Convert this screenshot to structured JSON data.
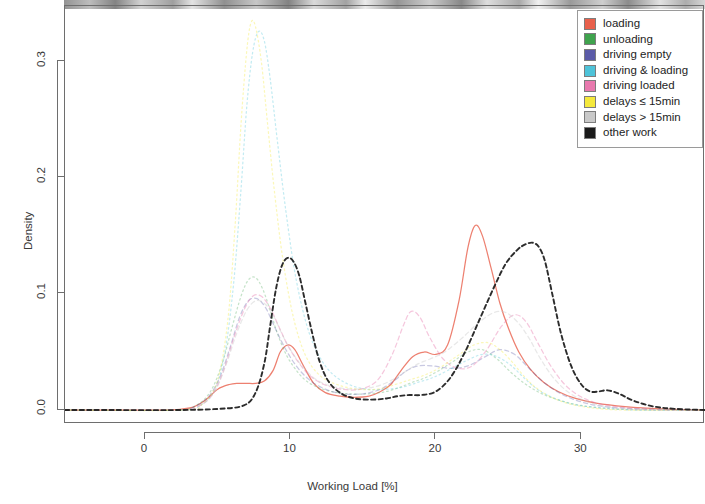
{
  "chart_data": {
    "type": "line",
    "title": "",
    "xlabel": "Working Load [%]",
    "ylabel": "Density",
    "xlim": [
      -5.5,
      38.5
    ],
    "ylim": [
      -0.012,
      0.348
    ],
    "xticks": [
      0,
      10,
      20,
      30
    ],
    "xtick_labels": [
      "0",
      "10",
      "20",
      "30"
    ],
    "yticks": [
      0.0,
      0.1,
      0.2,
      0.3
    ],
    "ytick_labels": [
      "0.0",
      "0.1",
      "0.2",
      "0.3"
    ],
    "grid": false,
    "legend_position": "top-right",
    "series": [
      {
        "name": "loading",
        "color": "#E8604C",
        "dash": "solid",
        "x": [
          -5.5,
          1.0,
          2.6,
          3.4,
          4.2,
          5.0,
          5.8,
          6.4,
          7.0,
          7.6,
          8.2,
          8.8,
          9.3,
          9.8,
          10.3,
          10.9,
          11.6,
          12.4,
          13.4,
          14.4,
          15.4,
          16.2,
          16.9,
          17.6,
          18.4,
          19.2,
          20.0,
          20.8,
          21.6,
          22.2,
          22.7,
          23.2,
          23.8,
          24.4,
          25.0,
          25.7,
          26.5,
          27.4,
          28.4,
          29.6,
          31.0,
          33.0,
          35.5,
          38.5
        ],
        "y": [
          0.0,
          0.0,
          0.001,
          0.003,
          0.009,
          0.018,
          0.022,
          0.023,
          0.023,
          0.023,
          0.025,
          0.034,
          0.05,
          0.056,
          0.052,
          0.038,
          0.023,
          0.015,
          0.012,
          0.011,
          0.012,
          0.016,
          0.022,
          0.034,
          0.046,
          0.05,
          0.048,
          0.056,
          0.095,
          0.14,
          0.159,
          0.15,
          0.122,
          0.092,
          0.07,
          0.05,
          0.035,
          0.024,
          0.016,
          0.01,
          0.006,
          0.003,
          0.001,
          0.0
        ]
      },
      {
        "name": "unloading",
        "color": "#3FA34D",
        "dash": "dotted",
        "x": [
          -5.5,
          2.0,
          3.5,
          4.5,
          5.3,
          6.0,
          6.6,
          7.1,
          7.6,
          8.1,
          8.6,
          9.1,
          9.7,
          10.3,
          11.0,
          11.8,
          12.8,
          14.0,
          15.4,
          16.6,
          17.6,
          18.4,
          19.3,
          20.2,
          21.2,
          22.2,
          23.2,
          24.2,
          25.2,
          26.2,
          27.3,
          28.6,
          30.0,
          32.0,
          35.0,
          38.5
        ],
        "y": [
          0.0,
          0.0,
          0.004,
          0.016,
          0.04,
          0.072,
          0.098,
          0.112,
          0.114,
          0.104,
          0.086,
          0.066,
          0.048,
          0.036,
          0.026,
          0.02,
          0.016,
          0.014,
          0.014,
          0.016,
          0.02,
          0.024,
          0.028,
          0.034,
          0.042,
          0.05,
          0.052,
          0.044,
          0.032,
          0.022,
          0.014,
          0.008,
          0.004,
          0.001,
          0.0,
          0.0
        ]
      },
      {
        "name": "driving empty",
        "color": "#5B5BA8",
        "dash": "dashed",
        "x": [
          -5.5,
          2.0,
          3.4,
          4.4,
          5.2,
          5.9,
          6.5,
          7.1,
          7.7,
          8.3,
          8.9,
          9.6,
          10.4,
          11.3,
          12.4,
          13.6,
          15.0,
          16.2,
          17.2,
          18.0,
          18.8,
          19.8,
          21.0,
          22.2,
          23.4,
          24.4,
          25.4,
          26.4,
          27.4,
          28.6,
          30.0,
          31.6,
          34.0,
          38.5
        ],
        "y": [
          0.0,
          0.0,
          0.003,
          0.012,
          0.03,
          0.056,
          0.08,
          0.094,
          0.096,
          0.088,
          0.072,
          0.054,
          0.038,
          0.026,
          0.018,
          0.014,
          0.014,
          0.018,
          0.026,
          0.034,
          0.038,
          0.038,
          0.036,
          0.038,
          0.046,
          0.052,
          0.048,
          0.036,
          0.024,
          0.014,
          0.007,
          0.003,
          0.001,
          0.0
        ]
      },
      {
        "name": "driving & loading",
        "color": "#4EC3D9",
        "dash": "dotted",
        "x": [
          -5.5,
          2.4,
          3.8,
          4.8,
          5.5,
          6.1,
          6.6,
          7.0,
          7.4,
          7.8,
          8.2,
          8.6,
          9.1,
          9.7,
          10.4,
          11.3,
          12.4,
          13.7,
          15.2,
          16.6,
          17.8,
          18.8,
          19.8,
          20.8,
          22.0,
          23.2,
          24.2,
          25.2,
          26.2,
          27.2,
          28.4,
          29.8,
          31.5,
          34.0,
          38.5
        ],
        "y": [
          0.0,
          0.0,
          0.004,
          0.018,
          0.05,
          0.11,
          0.19,
          0.262,
          0.308,
          0.326,
          0.318,
          0.286,
          0.232,
          0.17,
          0.112,
          0.066,
          0.038,
          0.024,
          0.018,
          0.018,
          0.02,
          0.024,
          0.028,
          0.034,
          0.042,
          0.048,
          0.046,
          0.038,
          0.026,
          0.016,
          0.009,
          0.004,
          0.002,
          0.0,
          0.0
        ]
      },
      {
        "name": "driving loaded",
        "color": "#E879AE",
        "dash": "dashed",
        "x": [
          -5.5,
          2.2,
          3.6,
          4.6,
          5.4,
          6.1,
          6.8,
          7.4,
          8.0,
          8.6,
          9.2,
          9.8,
          10.5,
          11.3,
          12.3,
          13.5,
          14.8,
          16.0,
          17.0,
          17.8,
          18.3,
          18.9,
          19.6,
          20.5,
          21.5,
          22.5,
          23.5,
          24.5,
          25.4,
          26.2,
          27.0,
          28.0,
          29.2,
          30.8,
          33.0,
          36.0,
          38.5
        ],
        "y": [
          0.0,
          0.0,
          0.003,
          0.013,
          0.034,
          0.062,
          0.086,
          0.098,
          0.098,
          0.088,
          0.072,
          0.056,
          0.042,
          0.03,
          0.022,
          0.018,
          0.018,
          0.026,
          0.048,
          0.074,
          0.085,
          0.08,
          0.062,
          0.044,
          0.036,
          0.038,
          0.052,
          0.072,
          0.082,
          0.076,
          0.058,
          0.036,
          0.018,
          0.007,
          0.002,
          0.0,
          0.0
        ]
      },
      {
        "name": "delays ≤ 15min",
        "color": "#F5E93C",
        "dash": "dotted",
        "x": [
          -5.5,
          2.6,
          4.0,
          5.0,
          5.7,
          6.2,
          6.6,
          7.0,
          7.3,
          7.6,
          8.0,
          8.4,
          8.9,
          9.5,
          10.2,
          11.0,
          12.0,
          13.2,
          14.6,
          16.0,
          17.2,
          18.2,
          19.2,
          20.2,
          21.4,
          22.6,
          23.6,
          24.4,
          25.2,
          26.0,
          26.8,
          27.8,
          29.0,
          30.6,
          33.0,
          38.5
        ],
        "y": [
          0.0,
          0.0,
          0.006,
          0.026,
          0.078,
          0.16,
          0.246,
          0.31,
          0.334,
          0.33,
          0.3,
          0.25,
          0.188,
          0.128,
          0.08,
          0.048,
          0.03,
          0.022,
          0.018,
          0.018,
          0.022,
          0.026,
          0.03,
          0.036,
          0.046,
          0.056,
          0.058,
          0.052,
          0.042,
          0.03,
          0.02,
          0.012,
          0.006,
          0.002,
          0.0,
          0.0
        ]
      },
      {
        "name": "delays > 15min",
        "color": "#C9C9C9",
        "dash": "dashed",
        "x": [
          -5.5,
          2.2,
          3.8,
          4.8,
          5.6,
          6.3,
          7.0,
          7.6,
          8.2,
          8.8,
          9.4,
          10.0,
          10.8,
          11.8,
          13.0,
          14.4,
          15.8,
          17.0,
          18.0,
          18.8,
          19.6,
          20.6,
          21.8,
          23.0,
          24.0,
          24.8,
          25.6,
          26.4,
          27.2,
          28.2,
          29.4,
          31.0,
          33.0,
          36.0,
          38.5
        ],
        "y": [
          0.0,
          0.0,
          0.004,
          0.016,
          0.04,
          0.066,
          0.086,
          0.094,
          0.092,
          0.082,
          0.066,
          0.052,
          0.038,
          0.026,
          0.02,
          0.018,
          0.02,
          0.026,
          0.034,
          0.04,
          0.044,
          0.05,
          0.062,
          0.076,
          0.084,
          0.084,
          0.076,
          0.062,
          0.044,
          0.026,
          0.013,
          0.005,
          0.001,
          0.0,
          0.0
        ]
      },
      {
        "name": "other work",
        "color": "#1A1A1A",
        "dash": "dashed",
        "x": [
          -5.5,
          -2.0,
          2.0,
          5.0,
          6.8,
          7.6,
          8.2,
          8.6,
          9.0,
          9.4,
          9.8,
          10.2,
          10.6,
          11.0,
          11.5,
          12.0,
          12.6,
          13.4,
          14.4,
          15.6,
          16.6,
          17.4,
          18.2,
          19.0,
          20.0,
          21.0,
          22.0,
          23.0,
          24.0,
          24.8,
          25.6,
          26.2,
          26.7,
          27.1,
          27.5,
          28.0,
          28.6,
          29.3,
          30.0,
          30.6,
          31.2,
          31.8,
          32.6,
          33.6,
          35.0,
          36.5,
          38.5
        ],
        "y": [
          0.0,
          0.0,
          0.0,
          0.001,
          0.004,
          0.015,
          0.04,
          0.072,
          0.104,
          0.124,
          0.131,
          0.128,
          0.116,
          0.094,
          0.066,
          0.042,
          0.025,
          0.015,
          0.01,
          0.009,
          0.01,
          0.012,
          0.013,
          0.013,
          0.016,
          0.028,
          0.05,
          0.078,
          0.106,
          0.126,
          0.138,
          0.143,
          0.144,
          0.14,
          0.128,
          0.1,
          0.066,
          0.038,
          0.022,
          0.016,
          0.016,
          0.017,
          0.014,
          0.008,
          0.003,
          0.001,
          0.0
        ]
      }
    ]
  },
  "legend": {
    "items": [
      {
        "label": "loading",
        "color": "#E8604C"
      },
      {
        "label": "unloading",
        "color": "#3FA34D"
      },
      {
        "label": "driving empty",
        "color": "#5B5BA8"
      },
      {
        "label": "driving & loading",
        "color": "#4EC3D9"
      },
      {
        "label": "driving loaded",
        "color": "#E879AE"
      },
      {
        "label": "delays ≤ 15min",
        "color": "#F5E93C"
      },
      {
        "label": "delays > 15min",
        "color": "#C9C9C9"
      },
      {
        "label": "other work",
        "color": "#1A1A1A"
      }
    ]
  },
  "axes": {
    "x_label": "Working Load [%]",
    "y_label": "Density",
    "x_ticks": [
      "0",
      "10",
      "20",
      "30"
    ],
    "y_ticks": [
      "0.0",
      "0.1",
      "0.2",
      "0.3"
    ]
  }
}
